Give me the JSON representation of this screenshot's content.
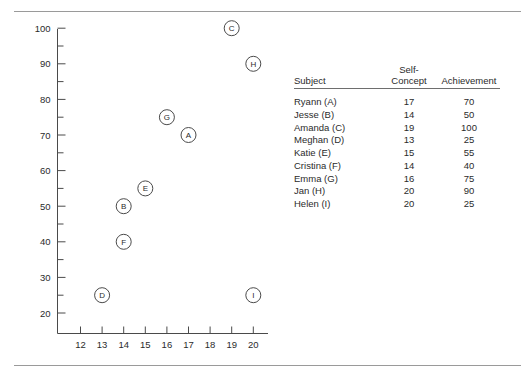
{
  "chart_data": {
    "type": "scatter",
    "title": "",
    "xlabel": "",
    "ylabel": "",
    "xlim": [
      11.3,
      20.6
    ],
    "ylim": [
      16.5,
      103
    ],
    "grid": false,
    "legend": "none",
    "x_ticks": [
      12,
      13,
      14,
      15,
      16,
      17,
      18,
      19,
      20
    ],
    "y_ticks": [
      20,
      30,
      40,
      50,
      60,
      70,
      80,
      90,
      100
    ],
    "y_minor_ticks": [
      25,
      35,
      45,
      55,
      65,
      75,
      85,
      95
    ],
    "point_labels": [
      "A",
      "B",
      "C",
      "D",
      "E",
      "F",
      "G",
      "H",
      "I"
    ],
    "x": [
      17,
      14,
      19,
      13,
      15,
      14,
      16,
      20,
      20
    ],
    "y": [
      70,
      50,
      100,
      25,
      55,
      40,
      75,
      90,
      25
    ],
    "points": [
      {
        "label": "A",
        "x": 17,
        "y": 70
      },
      {
        "label": "B",
        "x": 14,
        "y": 50
      },
      {
        "label": "C",
        "x": 19,
        "y": 100
      },
      {
        "label": "D",
        "x": 13,
        "y": 25
      },
      {
        "label": "E",
        "x": 15,
        "y": 55
      },
      {
        "label": "F",
        "x": 14,
        "y": 40
      },
      {
        "label": "G",
        "x": 16,
        "y": 75
      },
      {
        "label": "H",
        "x": 20,
        "y": 90
      },
      {
        "label": "I",
        "x": 20,
        "y": 25
      }
    ]
  },
  "table": {
    "headers": {
      "subject": "Subject",
      "self_concept_line1": "Self-",
      "self_concept_line2": "Concept",
      "achievement": "Achievement"
    },
    "rows": [
      {
        "subject": "Ryann (A)",
        "self_concept": "17",
        "achievement": "70"
      },
      {
        "subject": "Jesse (B)",
        "self_concept": "14",
        "achievement": "50"
      },
      {
        "subject": "Amanda (C)",
        "self_concept": "19",
        "achievement": "100"
      },
      {
        "subject": "Meghan (D)",
        "self_concept": "13",
        "achievement": "25"
      },
      {
        "subject": "Katie (E)",
        "self_concept": "15",
        "achievement": "55"
      },
      {
        "subject": "Cristina (F)",
        "self_concept": "14",
        "achievement": "40"
      },
      {
        "subject": "Emma (G)",
        "self_concept": "16",
        "achievement": "75"
      },
      {
        "subject": "Jan (H)",
        "self_concept": "20",
        "achievement": "90"
      },
      {
        "subject": "Helen (I)",
        "self_concept": "20",
        "achievement": "25"
      }
    ]
  },
  "colors": {
    "rule": "#9a9a9a",
    "axis": "#4a4a4a",
    "text": "#2b2b2b",
    "background": "#ffffff"
  }
}
